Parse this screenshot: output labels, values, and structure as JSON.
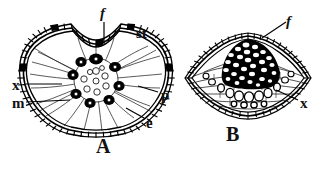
{
  "figure": {
    "kind": "botanical-cross-section-line-drawing",
    "background_color": "#ffffff",
    "ink_color": "#000000",
    "panels": [
      {
        "id": "A",
        "caption": "A",
        "description": "broad leaf cross-section with ring of vascular bundles"
      },
      {
        "id": "B",
        "caption": "B",
        "description": "narrow wing-shaped cross-section with large dark fibre cap"
      }
    ]
  },
  "labels": {
    "fibres_a": "f",
    "stereome": "st",
    "xylem_a": "x",
    "mesophyll": "m",
    "phloem": "p",
    "epidermis": "e",
    "panel_a": "A",
    "fibres_b": "f",
    "xylem_b": "x",
    "panel_b": "B"
  },
  "legend_meaning": {
    "f": "fibres",
    "st": "stereome",
    "x": "xylem",
    "m": "mesophyll",
    "p": "phloem",
    "e": "epidermis"
  }
}
